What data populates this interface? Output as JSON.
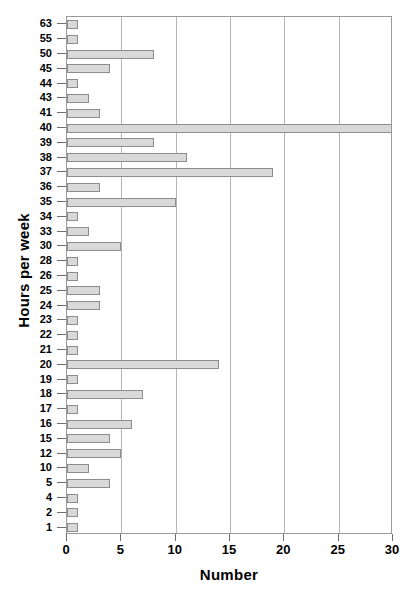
{
  "chart_data": {
    "type": "bar",
    "orientation": "horizontal",
    "title": "",
    "xlabel": "Number",
    "ylabel": "Hours per week",
    "xlim": [
      0,
      30
    ],
    "xticks": [
      0,
      5,
      10,
      15,
      20,
      25,
      30
    ],
    "grid": "vertical",
    "legend": "none",
    "categories": [
      "63",
      "55",
      "50",
      "45",
      "44",
      "43",
      "41",
      "40",
      "39",
      "38",
      "37",
      "36",
      "35",
      "34",
      "33",
      "30",
      "28",
      "26",
      "25",
      "24",
      "23",
      "22",
      "21",
      "20",
      "19",
      "18",
      "17",
      "16",
      "15",
      "12",
      "10",
      "5",
      "4",
      "2",
      "1"
    ],
    "values": [
      1,
      1,
      8,
      4,
      1,
      2,
      3,
      30,
      8,
      11,
      19,
      3,
      10,
      1,
      2,
      5,
      1,
      1,
      3,
      3,
      1,
      1,
      1,
      14,
      1,
      7,
      1,
      6,
      4,
      5,
      2,
      4,
      1,
      1,
      1
    ],
    "colors": {
      "bar_fill": "#d9d9d9",
      "bar_border": "#8c8c8c",
      "gridline": "#b4b4b4",
      "axis": "#9a9a9a",
      "text": "#000000",
      "background": "#ffffff"
    }
  }
}
